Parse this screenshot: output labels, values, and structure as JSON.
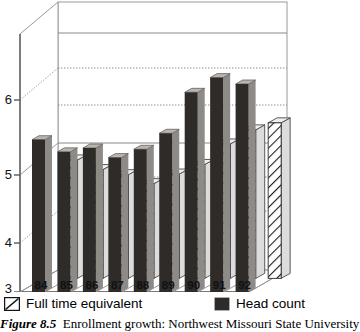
{
  "caption": {
    "label": "Figure 8.5",
    "text": "Enrollment growth: Northwest Missouri State University"
  },
  "legend": {
    "fte_label": "Full time equivalent",
    "head_label": "Head count",
    "fte_swatch_name": "hatched-swatch",
    "head_swatch_name": "solid-dark-swatch"
  },
  "colors": {
    "head_count": "#2e2b28",
    "head_count_top": "#b9b5b0",
    "head_count_side": "#8e8a85",
    "fte_fill": "#ffffff",
    "fte_hatch": "#1a1a1a",
    "fte_top": "#efefef",
    "axis": "#6d6d6d",
    "grid": "#8a8a8a",
    "background": "#ffffff"
  },
  "chart_data": {
    "type": "bar",
    "title": "Enrollment growth: Northwest Missouri State University",
    "xlabel": "",
    "ylabel": "",
    "ylim": [
      3,
      6.6
    ],
    "yticks": [
      3,
      4,
      5,
      6
    ],
    "ytick_labels": [
      "3",
      "4",
      "5",
      "6"
    ],
    "grid": true,
    "legend_position": "below",
    "three_d": true,
    "units": "thousands of students",
    "categories": [
      "84",
      "85",
      "86",
      "87",
      "88",
      "89",
      "90",
      "91",
      "92"
    ],
    "series": [
      {
        "name": "Full time equivalent",
        "values": [
          4.85,
          4.7,
          4.62,
          4.48,
          4.63,
          4.78,
          5.1,
          5.32,
          5.43
        ]
      },
      {
        "name": "Head count",
        "values": [
          5.38,
          5.19,
          5.25,
          5.1,
          5.23,
          5.48,
          6.12,
          6.35,
          6.25
        ]
      }
    ]
  }
}
